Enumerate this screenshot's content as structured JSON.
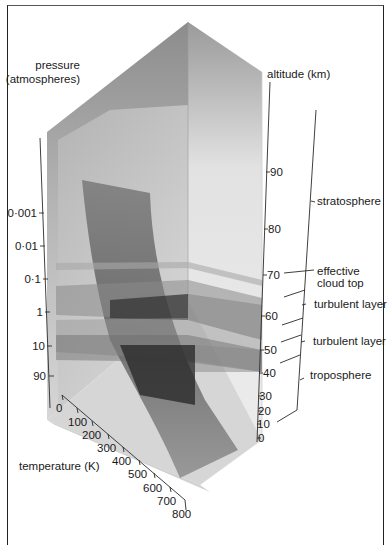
{
  "diagram": {
    "pressure_axis": {
      "title_line1": "pressure",
      "title_line2": "(atmospheres)",
      "ticks": [
        "0·001",
        "0·01",
        "0·1",
        "1",
        "10",
        "90"
      ]
    },
    "altitude_axis": {
      "title": "altitude (km)",
      "ticks": [
        "90",
        "80",
        "70",
        "60",
        "50",
        "40",
        "30",
        "20",
        "10",
        "0"
      ]
    },
    "temperature_axis": {
      "title": "temperature (K)",
      "ticks": [
        "0",
        "100",
        "200",
        "300",
        "400",
        "500",
        "600",
        "700",
        "800"
      ]
    },
    "regions": [
      {
        "label": "stratosphere"
      },
      {
        "label_line1": "effective",
        "label_line2": "cloud top"
      },
      {
        "label": "turbulent layer"
      },
      {
        "label": "turbulent layer"
      },
      {
        "label": "troposphere"
      }
    ],
    "colors": {
      "box_face_dark": "#8a8a8a",
      "box_face_light": "#d8d8d8",
      "curve_surface": "#5a5a5a",
      "layer_dark": "#3a3a3a"
    }
  }
}
